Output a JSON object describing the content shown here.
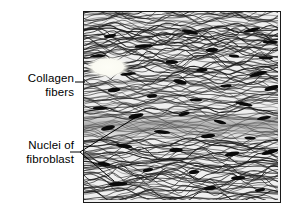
{
  "figure": {
    "type": "histology-illustration",
    "labels": [
      {
        "id": "collagen-fibers",
        "text": "Collagen\nfibers",
        "line1": "Collagen",
        "line2": "fibers",
        "leader": "horizontal",
        "leader_points": "75,82 85,82"
      },
      {
        "id": "nuclei-of-fibroblast",
        "text": "Nuclei of\nfibroblast",
        "line1": "Nuclei of",
        "line2": "fibroblast",
        "leader": "branched",
        "leader_points": "70,152 80,152 141,114 M 80,152 L 114,181"
      }
    ],
    "frame": {
      "x": 83,
      "y": 11,
      "width": 196,
      "height": 190,
      "border_color": "#1a1a1a",
      "border_width": 1
    },
    "colors": {
      "background": "#ffffff",
      "text": "#000000",
      "leader_line": "#000000",
      "fiber_dark": "#1c1c1c",
      "fiber_light": "#f4f4f4",
      "nucleus": "#0a0a0a",
      "pale_patch": "#fbfbf4",
      "dense_band": "#6e6e6e"
    },
    "content_description": {
      "fibers": "wavy horizontal collagen fiber bundles",
      "nuclei": "dark elongated lens-shaped fibroblast nuclei",
      "nuclei_count": 38,
      "fiber_line_count": 150
    }
  }
}
